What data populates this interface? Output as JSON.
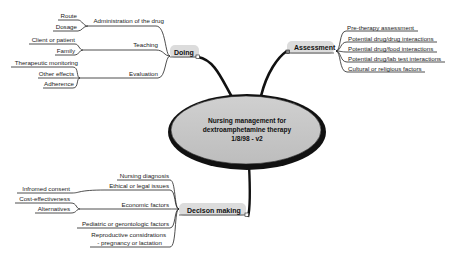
{
  "central_topic": {
    "lines": [
      "Nursing management for",
      "dextroamphetamine therapy",
      "1/8/98 - v2"
    ]
  },
  "branches": {
    "doing": {
      "label": "Doing",
      "subtopics": [
        {
          "label": "Administration of the drug",
          "children": [
            "Route",
            "Dosage"
          ]
        },
        {
          "label": "Teaching",
          "children": [
            "Client or patient",
            "Family"
          ]
        },
        {
          "label": "Evaluation",
          "children": [
            "Therapeutic monitoring",
            "Other effects",
            "Adherence"
          ]
        }
      ]
    },
    "assessment": {
      "label": "Assessment",
      "subtopics": [
        "Pre-therapy assessment",
        "Potential drug/drug interactions",
        "Potential drug/food interactions",
        "Potential drug/lab test interactions",
        "Cultural or religious factors"
      ]
    },
    "decision_making": {
      "label": "Decison making",
      "subtopics": [
        {
          "label": "Nursing diagnosis",
          "children": []
        },
        {
          "label": "Ethical or legal issues",
          "children": [
            "Infromed consent"
          ]
        },
        {
          "label": "Economic factors",
          "children": [
            "Cost-effectiveness",
            "Alternatives"
          ]
        },
        {
          "label": "Pediatric or gerontologic factors",
          "children": []
        },
        {
          "label": "Reproductive considrations",
          "label2": "- pregnancy or lactation",
          "children": []
        }
      ]
    }
  },
  "colors": {
    "central_fill": "#c8c8c8",
    "central_border": "#111111",
    "branch_fill": "#dcdcdc",
    "line": "#222222"
  }
}
